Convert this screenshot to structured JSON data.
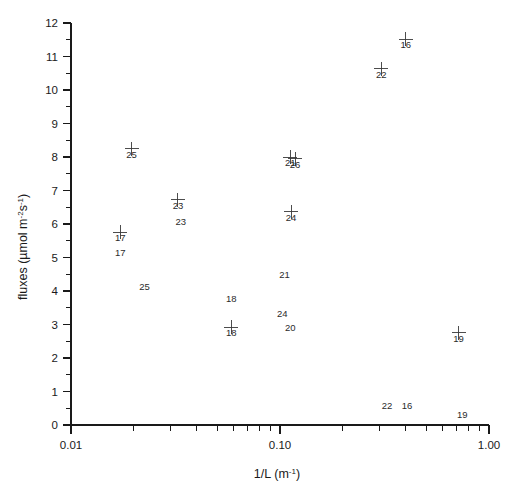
{
  "figure": {
    "background_color": "#ffffff",
    "axis_color": "#1a1a1a",
    "marker_color": "#3a3a3a",
    "top_cropped_text": "",
    "marker_symbol": "plus"
  },
  "axes": {
    "x": {
      "label_text": "1/L (m",
      "label_sup": "-1",
      "label_tail": ")",
      "scale": "log",
      "min": 0.01,
      "max": 1.0,
      "tick_labels": [
        "0.01",
        "0.10",
        "1.00"
      ],
      "tick_values": [
        0.01,
        0.1,
        1.0
      ]
    },
    "y": {
      "label_lead": "fluxes (",
      "label_mu": "µmol  m",
      "label_sup1": "-2",
      "label_mid": "s",
      "label_sup2": "-1",
      "label_tail": ")",
      "scale": "linear",
      "min": 0,
      "max": 12,
      "tick_labels": [
        "0",
        "1",
        "2",
        "3",
        "4",
        "5",
        "6",
        "7",
        "8",
        "9",
        "10",
        "11",
        "12"
      ],
      "tick_values": [
        0,
        1,
        2,
        3,
        4,
        5,
        6,
        7,
        8,
        9,
        10,
        11,
        12
      ],
      "minor_step": 0.5
    }
  },
  "chart_data": {
    "type": "scatter",
    "title": "",
    "xlabel": "1/L (m-1)",
    "ylabel": "fluxes (µmol m-2 s-1)",
    "xscale": "log",
    "yscale": "linear",
    "xlim": [
      0.01,
      1.0
    ],
    "ylim": [
      0,
      12
    ],
    "grid": false,
    "legend": "none",
    "marker": "plus-with-id-label",
    "xticks": [
      0.01,
      0.1,
      1.0
    ],
    "xticklabels": [
      "0.01",
      "0.10",
      "1.00"
    ],
    "yticks": [
      0,
      1,
      2,
      3,
      4,
      5,
      6,
      7,
      8,
      9,
      10,
      11,
      12
    ],
    "points": [
      {
        "id": "16",
        "x": 0.4,
        "y": 11.52
      },
      {
        "id": "22",
        "x": 0.305,
        "y": 10.64
      },
      {
        "id": "25",
        "x": 0.0195,
        "y": 8.24
      },
      {
        "id": "21",
        "x": 0.112,
        "y": 7.99
      },
      {
        "id": "26",
        "x": 0.118,
        "y": 7.95
      },
      {
        "id": "23",
        "x": 0.0325,
        "y": 6.72
      },
      {
        "id": "24",
        "x": 0.113,
        "y": 6.37
      },
      {
        "id": "17",
        "x": 0.0172,
        "y": 5.76
      },
      {
        "id": "18",
        "x": 0.0585,
        "y": 2.92
      },
      {
        "id": "19",
        "x": 0.715,
        "y": 2.76
      }
    ],
    "free_labels": [
      {
        "text": "17",
        "x": 0.0172,
        "y": 5.05
      },
      {
        "text": "25",
        "x": 0.0225,
        "y": 4.02
      },
      {
        "text": "21",
        "x": 0.105,
        "y": 4.4
      },
      {
        "text": "18",
        "x": 0.0585,
        "y": 3.68
      },
      {
        "text": "24",
        "x": 0.1025,
        "y": 3.22
      },
      {
        "text": "20",
        "x": 0.112,
        "y": 2.82
      },
      {
        "text": "23",
        "x": 0.0335,
        "y": 5.97
      },
      {
        "text": "22",
        "x": 0.325,
        "y": 0.47
      },
      {
        "text": "16",
        "x": 0.405,
        "y": 0.47
      },
      {
        "text": "19",
        "x": 0.745,
        "y": 0.2
      }
    ]
  }
}
